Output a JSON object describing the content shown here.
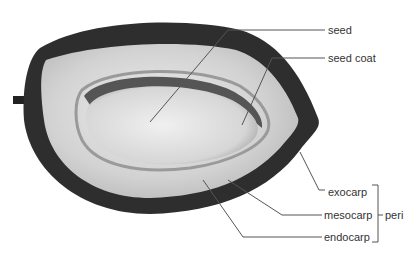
{
  "diagram": {
    "labels": {
      "seed": "seed",
      "seed_coat": "seed coat",
      "exocarp": "exocarp",
      "mesocarp": "mesocarp",
      "endocarp": "endocarp",
      "group": "peri"
    },
    "colors": {
      "outer_skin": "#2a2a2a",
      "flesh": "#d9d9d9",
      "seed": "#e6e6e6",
      "leader_line": "#555555",
      "text": "#333333"
    }
  }
}
